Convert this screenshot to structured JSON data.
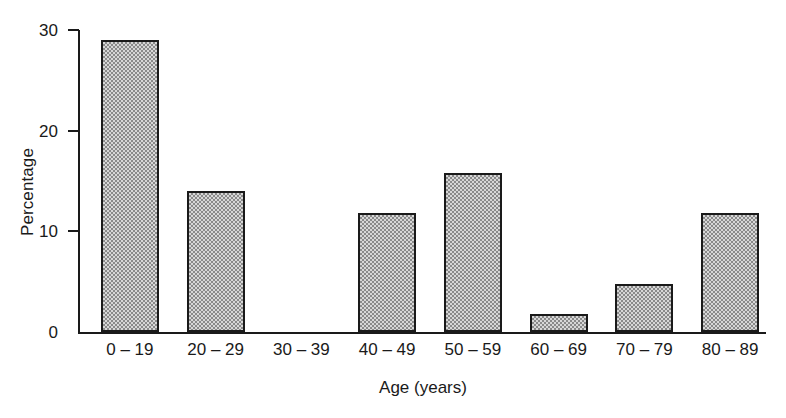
{
  "chart_data": {
    "type": "bar",
    "title": "",
    "subtitle": "",
    "xlabel": "Age (years)",
    "ylabel": "Percentage",
    "categories": [
      "0 – 19",
      "20 – 29",
      "30 – 39",
      "40 – 49",
      "50 – 59",
      "60 – 69",
      "70 – 79",
      "80 – 89"
    ],
    "values": [
      29.0,
      14.0,
      0.0,
      11.8,
      15.8,
      1.8,
      4.8,
      11.8
    ],
    "ylim": [
      0,
      30
    ],
    "yticks": [
      0,
      10,
      20,
      30
    ],
    "ytick_labels": [
      "0",
      "10",
      "20",
      "30"
    ],
    "xlim_categories": 8,
    "grid": false,
    "legend": false,
    "legend_position": "none",
    "annotations": [],
    "bar_fill": "#d7d7d7",
    "bar_pattern": "fine-checkerboard-gray",
    "bar_edge_color": "#1a1a1a",
    "axis_color": "#1a1a1a",
    "background": "#ffffff"
  }
}
